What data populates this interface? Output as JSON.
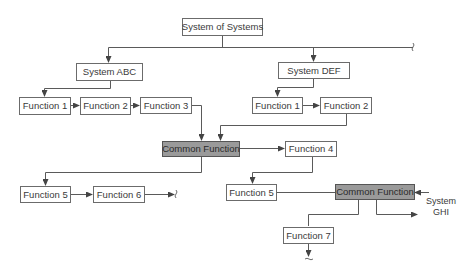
{
  "diagram": {
    "title": "System of Systems",
    "colors": {
      "line": "#5a5a5a",
      "box_border": "#6b6b6b",
      "box_fill": "#ffffff",
      "shared_fill": "#9a9a9a",
      "text": "#3a3a3a"
    },
    "nodes": {
      "root": "System of Systems",
      "system_abc": "System ABC",
      "system_def": "System DEF",
      "abc_function_1": "Function 1",
      "abc_function_2": "Function 2",
      "abc_function_3": "Function 3",
      "def_function_1": "Function 1",
      "def_function_2": "Function 2",
      "common_function_1": "Common Function",
      "function_4": "Function 4",
      "left_function_5": "Function 5",
      "function_6": "Function 6",
      "right_function_5": "Function 5",
      "common_function_2": "Common Function",
      "function_7": "Function 7"
    },
    "external": {
      "system_ghi_line1": "System",
      "system_ghi_line2": "GHI"
    },
    "edges": [
      {
        "from": "System of Systems",
        "to": "System ABC"
      },
      {
        "from": "System of Systems",
        "to": "System DEF"
      },
      {
        "from": "System of Systems",
        "to": "(continues, break)"
      },
      {
        "from": "System ABC",
        "to": "Function 1 (ABC)"
      },
      {
        "from": "Function 1 (ABC)",
        "to": "Function 2 (ABC)"
      },
      {
        "from": "Function 2 (ABC)",
        "to": "Function 3 (ABC)"
      },
      {
        "from": "Function 3 (ABC)",
        "to": "Common Function"
      },
      {
        "from": "System DEF",
        "to": "Function 1 (DEF)"
      },
      {
        "from": "Function 1 (DEF)",
        "to": "Function 2 (DEF)"
      },
      {
        "from": "Function 2 (DEF)",
        "to": "Common Function"
      },
      {
        "from": "Common Function",
        "to": "Function 4"
      },
      {
        "from": "Common Function",
        "to": "Function 5 (left)"
      },
      {
        "from": "Function 5 (left)",
        "to": "Function 6"
      },
      {
        "from": "Function 6",
        "to": "(continues, break)"
      },
      {
        "from": "Function 4",
        "to": "Function 5 (right)"
      },
      {
        "from": "Function 5 (right)",
        "to": "Common Function (2)"
      },
      {
        "from": "System GHI",
        "to": "Common Function (2)"
      },
      {
        "from": "Common Function (2)",
        "to": "System GHI"
      },
      {
        "from": "Common Function (2)",
        "to": "Function 7"
      },
      {
        "from": "Function 7",
        "to": "(continues, break)"
      }
    ]
  }
}
